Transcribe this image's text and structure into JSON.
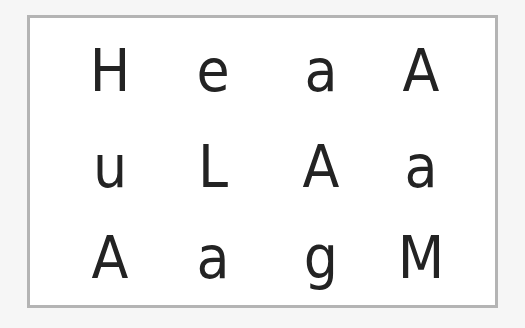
{
  "card": {
    "border_color": "#b4b4b4",
    "text_color": "#232323",
    "rows": [
      [
        "H",
        "e",
        "a",
        "A"
      ],
      [
        "u",
        "L",
        "A",
        "a"
      ],
      [
        "A",
        "a",
        "g",
        "M"
      ]
    ]
  }
}
